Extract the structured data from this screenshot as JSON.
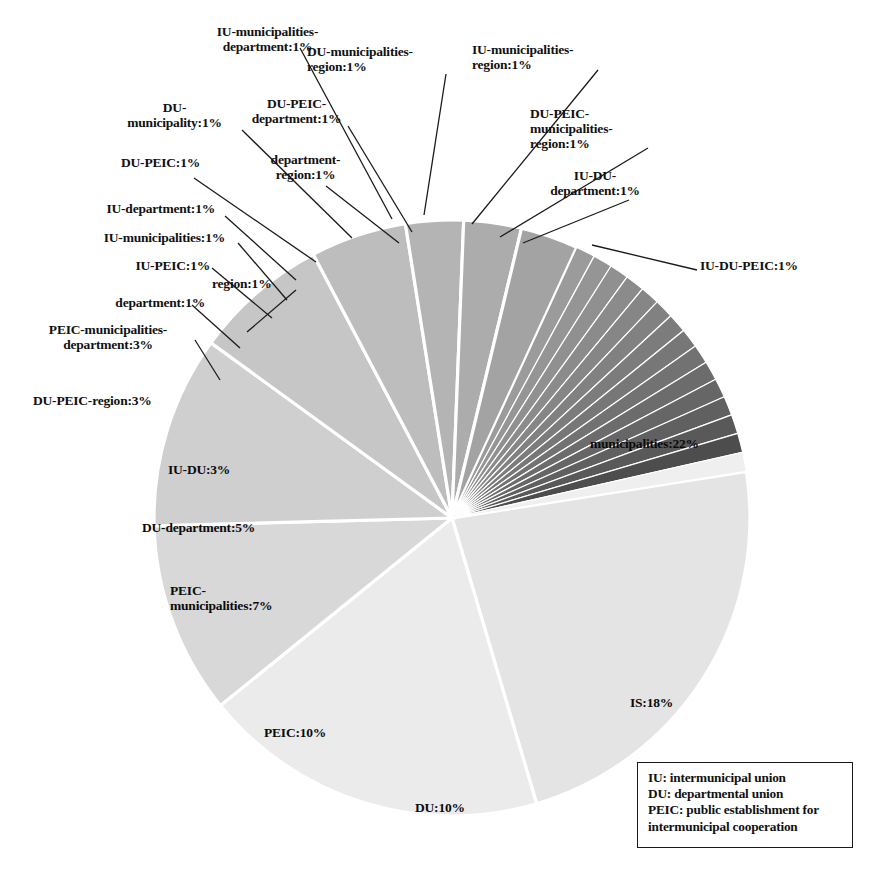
{
  "chart_data": {
    "type": "pie",
    "title": "",
    "units": "percent",
    "total": 100,
    "legend_position": "bottom-right",
    "grid": false,
    "categories": [
      "municipalities",
      "IS",
      "DU",
      "PEIC",
      "PEIC-municipalities",
      "DU-department",
      "IU-DU",
      "DU-PEIC-region",
      "PEIC-municipalities-department",
      "department",
      "region",
      "IU-PEIC",
      "IU-municipalities",
      "IU-department",
      "DU-PEIC",
      "DU-municipality",
      "DU-PEIC-department",
      "department-region",
      "IU-municipalities-department",
      "DU-municipalities-region",
      "IU-municipalities-region",
      "DU-PEIC-municipalities-region",
      "IU-DU-department",
      "IU-DU-PEIC"
    ],
    "values": [
      22,
      18,
      10,
      10,
      7,
      5,
      3,
      3,
      3,
      1,
      1,
      1,
      1,
      1,
      1,
      1,
      1,
      1,
      1,
      1,
      1,
      1,
      1,
      1
    ],
    "slice_labels": [
      "municipalities:22%",
      "IS:18%",
      "DU:10%",
      "PEIC:10%",
      "PEIC-\nmunicipalities:7%",
      "DU-department:5%",
      "IU-DU:3%",
      "DU-PEIC-region:3%",
      "PEIC-municipalities-\ndepartment:3%",
      "department:1%",
      "region:1%",
      "IU-PEIC:1%",
      "IU-municipalities:1%",
      "IU-department:1%",
      "DU-PEIC:1%",
      "DU-\nmunicipality:1%",
      "DU-PEIC-\ndepartment:1%",
      "department-\nregion:1%",
      "IU-municipalities-\ndepartment:1%",
      "DU-municipalities-\nregion:1%",
      "IU-municipalities-\nregion:1%",
      "DU-PEIC-\nmunicipalities-\nregion:1%",
      "IU-DU-\ndepartment:1%",
      "IU-DU-PEIC:1%"
    ],
    "slice_colors": [
      "#e4e4e4",
      "#ebebeb",
      "#d8d8d8",
      "#cfcfcf",
      "#c6c6c6",
      "#bdbdbd",
      "#b4b4b4",
      "#abacab",
      "#a3a3a3",
      "#9b9b9b",
      "#959595",
      "#909090",
      "#8b8b8b",
      "#868686",
      "#818181",
      "#7c7c7c",
      "#777777",
      "#727272",
      "#6c6c6c",
      "#666666",
      "#606060",
      "#595959",
      "#4d4d4d",
      "#efefef"
    ],
    "xlabel": "",
    "ylabel": ""
  },
  "legend": {
    "lines": [
      "IU: intermunicipal union",
      "DU: departmental union",
      "PEIC: public establishment for\nintermunicipal cooperation"
    ]
  }
}
